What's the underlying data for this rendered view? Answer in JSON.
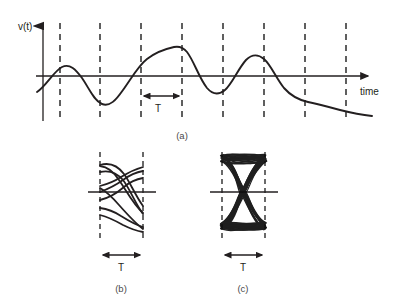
{
  "figure": {
    "title": "",
    "panels": [
      {
        "id": "a",
        "caption": "(a)",
        "type": "waveform",
        "y_axis_label": "v(t)",
        "x_axis_label": "time",
        "period_label": "T",
        "dashed_line_count": 8,
        "dashed_line_x": [
          60,
          100,
          141,
          182,
          223,
          264,
          305,
          346
        ],
        "baseline_y": 76,
        "span_marker": {
          "from_x": 141,
          "to_x": 182,
          "label": "T"
        },
        "line_color": "#231f20",
        "dash_color": "#2b2b2b"
      },
      {
        "id": "b",
        "caption": "(b)",
        "type": "eye-diagram-sparse",
        "period_label": "T",
        "trace_count": 8,
        "line_color": "#231f20",
        "dash_color": "#2b2b2b"
      },
      {
        "id": "c",
        "caption": "(c)",
        "type": "eye-diagram-dense",
        "period_label": "T",
        "trace_count": 60,
        "line_color": "#0d0d0d",
        "dash_color": "#2b2b2b"
      }
    ]
  },
  "chart_data": {
    "type": "line",
    "title": "",
    "xlabel": "time",
    "ylabel": "v(t)",
    "grid": false,
    "legend": null,
    "annotations": [
      "T",
      "(a)",
      "(b)",
      "(c)"
    ],
    "series": [
      {
        "name": "v(t)",
        "x": [
          37,
          45,
          53,
          60,
          68,
          77,
          86,
          95,
          104,
          113,
          122,
          131,
          141,
          151,
          161,
          171,
          182,
          192,
          202,
          212,
          223,
          233,
          243,
          253,
          264,
          274,
          284,
          294,
          305,
          315,
          326,
          336,
          346,
          356,
          366,
          376
        ],
        "y": [
          -16,
          -10,
          -3,
          5,
          9,
          6,
          -2,
          -13,
          -22,
          -27,
          -28,
          -24,
          -15,
          -4,
          9,
          20,
          28,
          30,
          25,
          12,
          -5,
          -16,
          -18,
          -11,
          2,
          14,
          20,
          18,
          9,
          -2,
          -10,
          -15,
          -19,
          -22,
          -24,
          -25
        ]
      }
    ],
    "markers": {
      "symbol_boundaries": [
        60,
        100,
        141,
        182,
        223,
        264,
        305,
        346
      ],
      "period_span": {
        "start": 141,
        "end": 182,
        "label": "T"
      }
    }
  }
}
